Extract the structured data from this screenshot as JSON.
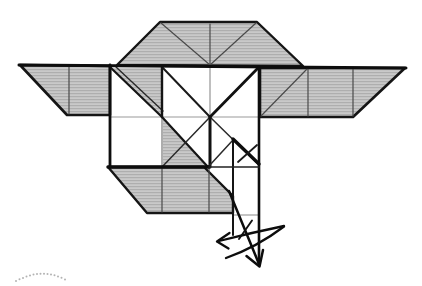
{
  "figure": {
    "kind": "origami-step-diagram",
    "canvas": {
      "width": 422,
      "height": 286,
      "background": "#ffffff"
    },
    "colors": {
      "paper_gray": "#c3c3c3",
      "paper_stripe": "#aeaeae",
      "line_dark": "#0d0d0d",
      "line_mid": "#4a4a4a",
      "line_light": "#9a9a9a",
      "dots": "#b3b3b3"
    },
    "shapes": [
      {
        "name": "top-trapezoid-fill",
        "type": "polygon",
        "points": [
          [
            117,
            65
          ],
          [
            160,
            22
          ],
          [
            257,
            22
          ],
          [
            303,
            66
          ]
        ],
        "fill": "tex",
        "stroke": "#151515",
        "width": 2.4
      },
      {
        "name": "top-trapezoid-center-crease",
        "type": "line",
        "x1": 210,
        "y1": 24,
        "x2": 210,
        "y2": 65,
        "stroke": "#4a4a4a",
        "width": 1.2
      },
      {
        "name": "top-trapezoid-left-crease",
        "type": "line",
        "x1": 161,
        "y1": 23,
        "x2": 210,
        "y2": 65,
        "stroke": "#4a4a4a",
        "width": 1.2
      },
      {
        "name": "top-trapezoid-right-crease",
        "type": "line",
        "x1": 256,
        "y1": 23,
        "x2": 210,
        "y2": 65,
        "stroke": "#4a4a4a",
        "width": 1.2
      },
      {
        "name": "left-wing-fill",
        "type": "polygon",
        "points": [
          [
            20,
            65
          ],
          [
            110,
            66
          ],
          [
            110,
            115
          ],
          [
            67,
            115
          ]
        ],
        "fill": "tex",
        "stroke": "#151515",
        "width": 2.6
      },
      {
        "name": "left-wing-crease",
        "type": "line",
        "x1": 69,
        "y1": 67,
        "x2": 69,
        "y2": 114,
        "stroke": "#4a4a4a",
        "width": 1.2
      },
      {
        "name": "right-wing-fill",
        "type": "polygon",
        "points": [
          [
            260,
            68
          ],
          [
            405,
            68
          ],
          [
            353,
            117
          ],
          [
            260,
            117
          ]
        ],
        "fill": "tex",
        "stroke": "#151515",
        "width": 2.6
      },
      {
        "name": "right-wing-diag-crease",
        "type": "line",
        "x1": 261,
        "y1": 116,
        "x2": 307,
        "y2": 69,
        "stroke": "#4a4a4a",
        "width": 1.2
      },
      {
        "name": "right-wing-crease-1",
        "type": "line",
        "x1": 308,
        "y1": 69,
        "x2": 308,
        "y2": 116,
        "stroke": "#4a4a4a",
        "width": 1.2
      },
      {
        "name": "right-wing-crease-2",
        "type": "line",
        "x1": 353,
        "y1": 69,
        "x2": 353,
        "y2": 116,
        "stroke": "#4a4a4a",
        "width": 1.2
      },
      {
        "name": "square-gray-triangle-topleft",
        "type": "polygon",
        "points": [
          [
            112,
            68
          ],
          [
            162,
            68
          ],
          [
            162,
            116
          ]
        ],
        "fill": "tex"
      },
      {
        "name": "square-gray-triangle-bottomleft",
        "type": "polygon",
        "points": [
          [
            163,
            118
          ],
          [
            163,
            166
          ],
          [
            206,
            166
          ]
        ],
        "fill": "tex"
      },
      {
        "name": "bottom-trapezoid-fill",
        "type": "polygon",
        "points": [
          [
            108,
            167
          ],
          [
            204,
            167
          ],
          [
            233,
            196
          ],
          [
            233,
            213
          ],
          [
            147,
            213
          ]
        ],
        "fill": "tex",
        "stroke": "#151515",
        "width": 2.4
      },
      {
        "name": "bottom-trapezoid-crease-1",
        "type": "line",
        "x1": 162,
        "y1": 168,
        "x2": 162,
        "y2": 212,
        "stroke": "#4a4a4a",
        "width": 1.2
      },
      {
        "name": "bottom-trapezoid-crease-2",
        "type": "line",
        "x1": 209,
        "y1": 168,
        "x2": 209,
        "y2": 212,
        "stroke": "#4a4a4a",
        "width": 1.2
      },
      {
        "name": "square-horizontal-midline",
        "type": "line",
        "x1": 110,
        "y1": 117,
        "x2": 259,
        "y2": 117,
        "stroke": "#9a9a9a",
        "width": 1.1
      },
      {
        "name": "square-vertical-162-lower",
        "type": "line",
        "x1": 162,
        "y1": 117,
        "x2": 162,
        "y2": 166,
        "stroke": "#6a6a6a",
        "width": 1.1
      },
      {
        "name": "square-vertical-210-upper",
        "type": "line",
        "x1": 210,
        "y1": 67,
        "x2": 210,
        "y2": 117,
        "stroke": "#8a8a8a",
        "width": 1.1
      },
      {
        "name": "flap-horizontal-crease",
        "type": "line",
        "x1": 233,
        "y1": 215,
        "x2": 258,
        "y2": 215,
        "stroke": "#8a8a8a",
        "width": 1.1
      },
      {
        "name": "main-diagonal-upper",
        "type": "line",
        "x1": 110,
        "y1": 67,
        "x2": 162,
        "y2": 117,
        "stroke": "#151515",
        "width": 2.2
      },
      {
        "name": "main-diagonal-double-edge",
        "type": "line",
        "x1": 116,
        "y1": 67,
        "x2": 163,
        "y2": 111,
        "stroke": "#2a2a2a",
        "width": 1.4
      },
      {
        "name": "main-diagonal-lower",
        "type": "line",
        "x1": 162,
        "y1": 117,
        "x2": 208,
        "y2": 167,
        "stroke": "#151515",
        "width": 2.2
      },
      {
        "name": "x-diagonal-nw",
        "type": "line",
        "x1": 162,
        "y1": 67,
        "x2": 210,
        "y2": 117,
        "stroke": "#1a1a1a",
        "width": 2.0
      },
      {
        "name": "x-diagonal-se",
        "type": "line",
        "x1": 210,
        "y1": 117,
        "x2": 259,
        "y2": 165,
        "stroke": "#2a2a2a",
        "width": 1.5
      },
      {
        "name": "x-diagonal-ne",
        "type": "line",
        "x1": 259,
        "y1": 67,
        "x2": 210,
        "y2": 117,
        "stroke": "#111111",
        "width": 2.8
      },
      {
        "name": "x-diagonal-sw",
        "type": "line",
        "x1": 210,
        "y1": 117,
        "x2": 162,
        "y2": 167,
        "stroke": "#2a2a2a",
        "width": 1.5
      },
      {
        "name": "square-vertical-162-upper",
        "type": "line",
        "x1": 162,
        "y1": 66,
        "x2": 162,
        "y2": 117,
        "stroke": "#151515",
        "width": 2.4
      },
      {
        "name": "square-vertical-210-lower",
        "type": "line",
        "x1": 210,
        "y1": 117,
        "x2": 210,
        "y2": 167,
        "stroke": "#111111",
        "width": 3.0
      },
      {
        "name": "tail-flap-peak-crease",
        "type": "line",
        "x1": 233,
        "y1": 140,
        "x2": 209,
        "y2": 166,
        "stroke": "#2a2a2a",
        "width": 1.5
      },
      {
        "name": "tail-flap-left-edge",
        "type": "line",
        "x1": 233,
        "y1": 140,
        "x2": 233,
        "y2": 235,
        "stroke": "#151515",
        "width": 2.0
      },
      {
        "name": "tail-flap-bold-crease",
        "type": "line",
        "x1": 233,
        "y1": 139,
        "x2": 259,
        "y2": 164,
        "stroke": "#0d0d0d",
        "width": 3.4
      },
      {
        "name": "tail-flap-cross-crease",
        "type": "line",
        "x1": 238,
        "y1": 162,
        "x2": 257,
        "y2": 145,
        "stroke": "#1a1a1a",
        "width": 1.8
      },
      {
        "name": "wing-top-edge",
        "type": "line",
        "x1": 19,
        "y1": 65,
        "x2": 406,
        "y2": 68,
        "stroke": "#0d0d0d",
        "width": 3.0
      },
      {
        "name": "square-left-edge",
        "type": "line",
        "x1": 110,
        "y1": 65,
        "x2": 110,
        "y2": 167,
        "stroke": "#0d0d0d",
        "width": 2.8
      },
      {
        "name": "square-right-edge-and-flap",
        "type": "line",
        "x1": 259,
        "y1": 67,
        "x2": 259,
        "y2": 265,
        "stroke": "#0d0d0d",
        "width": 2.6
      },
      {
        "name": "square-bottom-edge-thick",
        "type": "line",
        "x1": 108,
        "y1": 167,
        "x2": 209,
        "y2": 167,
        "stroke": "#0d0d0d",
        "width": 3.4
      },
      {
        "name": "square-bottom-edge-right",
        "type": "line",
        "x1": 209,
        "y1": 167,
        "x2": 259,
        "y2": 167,
        "stroke": "#222222",
        "width": 1.7
      },
      {
        "name": "fold-arrow-straight-shaft",
        "type": "path",
        "d": "M229,191 L259,264",
        "stroke": "#0d0d0d",
        "width": 2.5
      },
      {
        "name": "fold-arrow-down-arrowhead-icon",
        "type": "path",
        "d": "M246.5,256 L259.5,266.5 L263,250",
        "stroke": "#0d0d0d",
        "width": 2.5
      },
      {
        "name": "swing-arrow-upper-arc",
        "type": "path",
        "d": "M284,226 Q250,233 219,241",
        "stroke": "#0d0d0d",
        "width": 2.3
      },
      {
        "name": "swing-arrow-left-arrowhead-icon",
        "type": "path",
        "d": "M229.5,233 L217,241.5 L228.5,248.5",
        "stroke": "#0d0d0d",
        "width": 2.3
      },
      {
        "name": "swing-arrow-lower-arc",
        "type": "path",
        "d": "M284,226.5 Q257,247 226,258",
        "stroke": "#0d0d0d",
        "width": 2.3
      },
      {
        "name": "arrow-cross-tick",
        "type": "path",
        "d": "M252,220.5 L239,239",
        "stroke": "#111111",
        "width": 1.9
      },
      {
        "name": "corner-dotted-arc",
        "type": "dots",
        "r": 1.0,
        "fill": "#b3b3b3",
        "points": [
          [
            16,
            281
          ],
          [
            19.5,
            279.3
          ],
          [
            23,
            277.9
          ],
          [
            26.5,
            276.6
          ],
          [
            30,
            275.4
          ],
          [
            33.5,
            274.6
          ],
          [
            37,
            274
          ],
          [
            40.5,
            273.7
          ],
          [
            44,
            273.7
          ],
          [
            47.5,
            274
          ],
          [
            51,
            274.5
          ],
          [
            54.5,
            275.3
          ],
          [
            58,
            276.4
          ],
          [
            61.5,
            277.8
          ],
          [
            65,
            279.5
          ]
        ]
      }
    ]
  }
}
